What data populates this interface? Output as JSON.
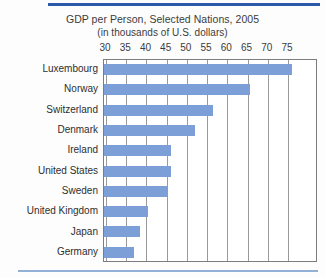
{
  "figure": {
    "title": "GDP per Person, Selected Nations, 2005",
    "subtitle": "(in thousands of U.S. dollars)",
    "rule_color_top": "#2d5aa8",
    "rule_color_bottom": "#93b0d8",
    "bar_color": "#7d9fd8",
    "grid_color": "#9a9a9a",
    "frame_color": "#7d7d7d"
  },
  "chart_data": {
    "type": "bar",
    "orientation": "horizontal",
    "title": "GDP per Person, Selected Nations, 2005",
    "subtitle": "(in thousands of U.S. dollars)",
    "xlabel": "",
    "ylabel": "",
    "xlim": [
      30,
      79
    ],
    "grid": true,
    "legend": false,
    "tick_labels": [
      "30",
      "35",
      "40",
      "45",
      "50",
      "55",
      "60",
      "65",
      "70",
      "75"
    ],
    "ticks": [
      30,
      35,
      40,
      45,
      50,
      55,
      60,
      65,
      70,
      75
    ],
    "categories": [
      "Luxembourg",
      "Norway",
      "Switzerland",
      "Denmark",
      "Ireland",
      "United States",
      "Sweden",
      "United Kingdom",
      "Japan",
      "Germany"
    ],
    "values": [
      76,
      65.5,
      56.5,
      52,
      46,
      46,
      45,
      40.5,
      38.5,
      37
    ]
  }
}
